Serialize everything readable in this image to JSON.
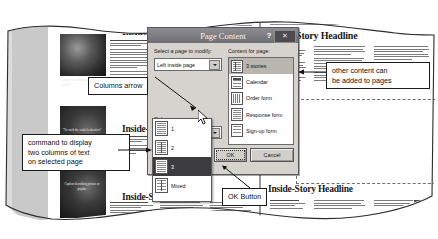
{
  "document": {
    "left_page": {
      "header_label": "Page 2",
      "headline": "Inside-Story Headline",
      "headline2": "Inside-Story Headline",
      "headline3": "Inside-Story Headline",
      "caption": "Caption describing picture or graphic.",
      "pullquote": "“To catch the reader's attention”"
    },
    "right_page": {
      "header_label": "Newsletter Title",
      "headline": "Inside-Story Headline",
      "headline2": "Inside-Story Headline"
    }
  },
  "dialog": {
    "title": "Page Content",
    "help_label": "?",
    "close_label": "✕",
    "page_select": {
      "label": "Select a page to modify:",
      "value": "Left inside page",
      "arrow_icon": "chevron-down-icon"
    },
    "content_list": {
      "label": "Content for page:",
      "items": [
        {
          "label": "3 stories",
          "icon": "three-columns-page-icon",
          "selected": true
        },
        {
          "label": "Calendar",
          "icon": "calendar-page-icon",
          "selected": false
        },
        {
          "label": "Order form",
          "icon": "order-form-page-icon",
          "selected": false
        },
        {
          "label": "Response form",
          "icon": "response-form-page-icon",
          "selected": false
        },
        {
          "label": "Sign-up form",
          "icon": "signup-form-page-icon",
          "selected": false
        }
      ]
    },
    "columns": {
      "label": "Columns:",
      "value": "1",
      "arrow_icon": "chevron-down-icon",
      "options": [
        {
          "label": "1",
          "icon": "one-column-icon",
          "selected": false
        },
        {
          "label": "2",
          "icon": "two-column-icon",
          "selected": false
        },
        {
          "label": "3",
          "icon": "three-column-icon",
          "selected": true
        },
        {
          "label": "Mixed",
          "icon": "mixed-column-icon",
          "selected": false
        }
      ]
    },
    "buttons": {
      "ok": "OK",
      "cancel": "Cancel"
    }
  },
  "callouts": [
    {
      "id": "columns-arrow",
      "text": "Columns arrow"
    },
    {
      "id": "two-columns-command",
      "text": "command to display\ntwo columns of text\non selected page"
    },
    {
      "id": "ok-button",
      "text": "OK Button"
    },
    {
      "id": "other-content",
      "text": "other content can\nbe added to pages"
    }
  ],
  "colors": {
    "dialog_face": "#d6d3ce",
    "title_bar": "#7e7d82",
    "selection": "#3c3b3d",
    "paper": "#ffffff",
    "gutter": "#c9c9c9"
  }
}
